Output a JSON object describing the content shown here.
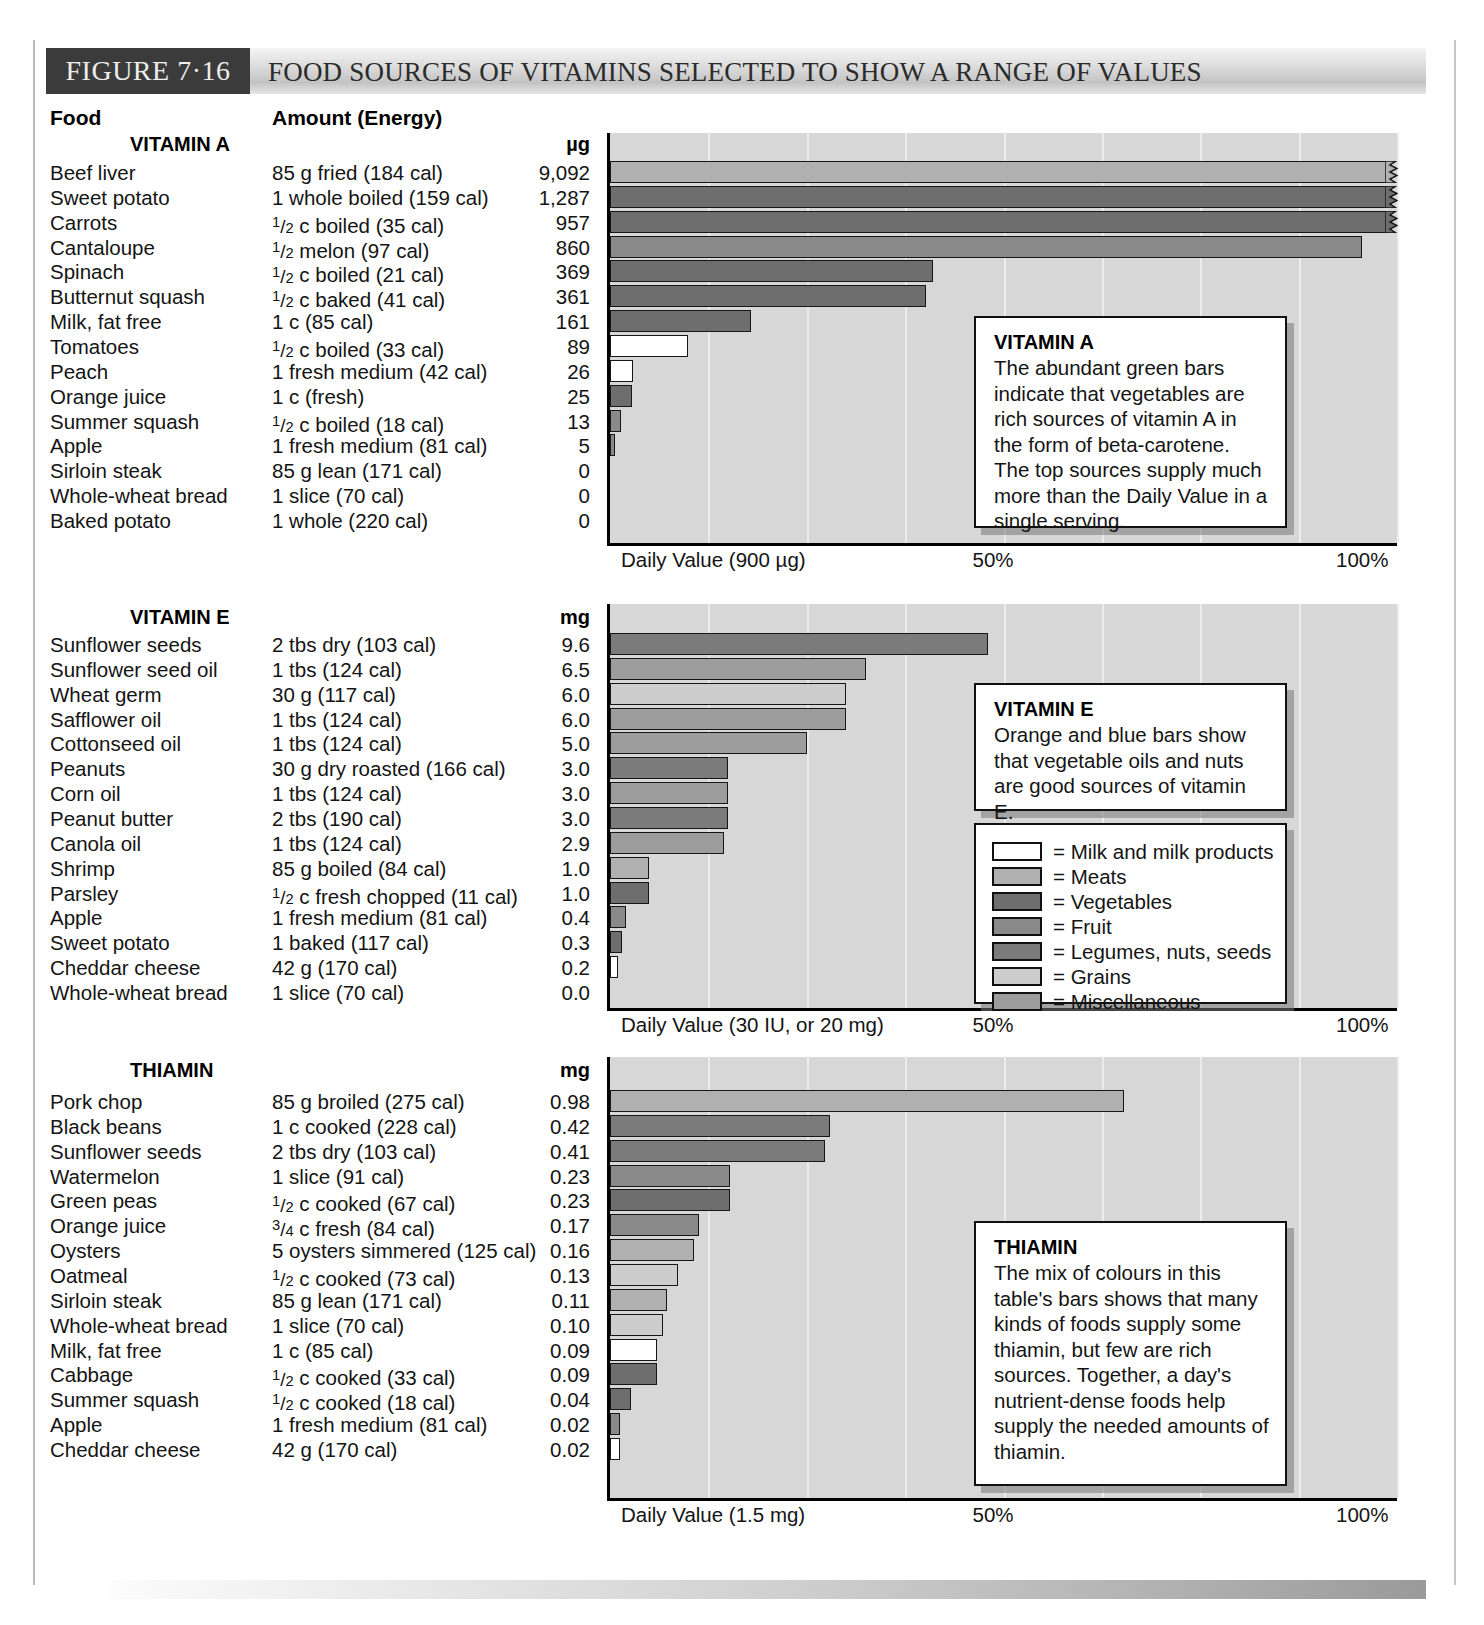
{
  "header": {
    "figure_tag": "FIGURE 7·16",
    "title": "FOOD SOURCES OF VITAMINS SELECTED TO SHOW A RANGE OF VALUES"
  },
  "columns": {
    "food": "Food",
    "amount": "Amount (Energy)"
  },
  "legend": {
    "items": [
      {
        "label": "= Milk and milk products",
        "key": "milk",
        "color": "#ffffff"
      },
      {
        "label": "= Meats",
        "key": "meat",
        "color": "#b0b0b0"
      },
      {
        "label": "= Vegetables",
        "key": "veg",
        "color": "#6e6e6e"
      },
      {
        "label": "= Fruit",
        "key": "fruit",
        "color": "#8a8a8a"
      },
      {
        "label": "= Legumes, nuts, seeds",
        "key": "legume",
        "color": "#7b7b7b"
      },
      {
        "label": "= Grains",
        "key": "grain",
        "color": "#cdcdcd"
      },
      {
        "label": "= Miscellaneous",
        "key": "misc",
        "color": "#9d9d9d"
      }
    ]
  },
  "callouts": {
    "vitamin_a": {
      "title": "VITAMIN A",
      "body": "The abundant green bars indicate that vegetables are rich sources of vitamin A in the form of beta-carotene. The top sources supply much more than the Daily Value in a single serving."
    },
    "vitamin_e": {
      "title": "VITAMIN E",
      "body": "Orange and blue bars show that vegetable oils and nuts are good sources of vitamin E."
    },
    "thiamin": {
      "title": "THIAMIN",
      "body": "The mix of colours in this table's bars shows that many kinds of foods supply some thiamin, but few are rich sources. Together, a day's nutrient-dense foods help supply the needed amounts of thiamin."
    }
  },
  "chart_data": [
    {
      "type": "bar",
      "title": "VITAMIN A",
      "unit": "µg",
      "xlabel": "Daily Value (900 µg)",
      "ticks": [
        "Daily Value (900 µg)",
        "50%",
        "100%"
      ],
      "xlim": [
        0,
        100
      ],
      "daily_value": 900,
      "daily_value_unit": "µg",
      "grid": true,
      "categories": [
        "Beef liver",
        "Sweet potato",
        "Carrots",
        "Cantaloupe",
        "Spinach",
        "Butternut squash",
        "Milk, fat free",
        "Tomatoes",
        "Peach",
        "Orange juice",
        "Summer squash",
        "Apple",
        "Sirloin steak",
        "Whole-wheat bread",
        "Baked potato"
      ],
      "amounts": [
        "85 g fried (184 cal)",
        "1 whole boiled (159 cal)",
        "½ c boiled (35 cal)",
        "½ melon (97 cal)",
        "½ c boiled (21 cal)",
        "½ c baked (41 cal)",
        "1 c (85 cal)",
        "½ c boiled (33 cal)",
        "1 fresh medium (42 cal)",
        "1 c (fresh)",
        "½ c boiled (18 cal)",
        "1 fresh medium (81 cal)",
        "85 g lean (171 cal)",
        "1 slice (70 cal)",
        "1 whole (220 cal)"
      ],
      "value_labels": [
        "9,092",
        "1,287",
        "957",
        "860",
        "369",
        "361",
        "161",
        "89",
        "26",
        "25",
        "13",
        "5",
        "0",
        "0",
        "0"
      ],
      "values": [
        9092,
        1287,
        957,
        860,
        369,
        361,
        161,
        89,
        26,
        25,
        13,
        5,
        0,
        0,
        0
      ],
      "percent_dv": [
        100,
        100,
        100,
        95.6,
        41.0,
        40.1,
        17.9,
        9.9,
        2.9,
        2.8,
        1.4,
        0.6,
        0,
        0,
        0
      ],
      "offscale": [
        true,
        true,
        true,
        false,
        false,
        false,
        false,
        false,
        false,
        false,
        false,
        false,
        false,
        false,
        false
      ],
      "groups": [
        "meat",
        "veg",
        "veg",
        "fruit",
        "veg",
        "veg",
        "veg",
        "milk",
        "milk",
        "veg",
        "fruit",
        "fruit",
        "meat",
        "grain",
        "veg"
      ]
    },
    {
      "type": "bar",
      "title": "VITAMIN E",
      "unit": "mg",
      "xlabel": "Daily Value (30 IU, or 20 mg)",
      "ticks": [
        "Daily Value (30 IU, or 20 mg)",
        "50%",
        "100%"
      ],
      "xlim": [
        0,
        100
      ],
      "daily_value": 20,
      "daily_value_unit": "mg",
      "grid": true,
      "categories": [
        "Sunflower seeds",
        "Sunflower seed oil",
        "Wheat germ",
        "Safflower oil",
        "Cottonseed oil",
        "Peanuts",
        "Corn oil",
        "Peanut butter",
        "Canola oil",
        "Shrimp",
        "Parsley",
        "Apple",
        "Sweet potato",
        "Cheddar cheese",
        "Whole-wheat bread"
      ],
      "amounts": [
        "2 tbs dry (103 cal)",
        "1 tbs (124 cal)",
        "30 g (117 cal)",
        "1 tbs (124 cal)",
        "1 tbs (124 cal)",
        "30 g dry roasted (166 cal)",
        "1 tbs (124 cal)",
        "2 tbs (190 cal)",
        "1 tbs (124 cal)",
        "85 g boiled (84 cal)",
        "½ c fresh chopped (11 cal)",
        "1 fresh medium (81 cal)",
        "1 baked (117 cal)",
        "42 g (170 cal)",
        "1 slice (70 cal)"
      ],
      "value_labels": [
        "9.6",
        "6.5",
        "6.0",
        "6.0",
        "5.0",
        "3.0",
        "3.0",
        "3.0",
        "2.9",
        "1.0",
        "1.0",
        "0.4",
        "0.3",
        "0.2",
        "0.0"
      ],
      "values": [
        9.6,
        6.5,
        6.0,
        6.0,
        5.0,
        3.0,
        3.0,
        3.0,
        2.9,
        1.0,
        1.0,
        0.4,
        0.3,
        0.2,
        0.0
      ],
      "percent_dv": [
        48,
        32.5,
        30,
        30,
        25,
        15,
        15,
        15,
        14.5,
        5,
        5,
        2,
        1.5,
        1,
        0
      ],
      "offscale": [
        false,
        false,
        false,
        false,
        false,
        false,
        false,
        false,
        false,
        false,
        false,
        false,
        false,
        false,
        false
      ],
      "groups": [
        "legume",
        "misc",
        "grain",
        "misc",
        "misc",
        "legume",
        "misc",
        "legume",
        "misc",
        "meat",
        "veg",
        "fruit",
        "veg",
        "milk",
        "grain"
      ]
    },
    {
      "type": "bar",
      "title": "THIAMIN",
      "unit": "mg",
      "xlabel": "Daily Value (1.5 mg)",
      "ticks": [
        "Daily Value (1.5 mg)",
        "50%",
        "100%"
      ],
      "xlim": [
        0,
        100
      ],
      "daily_value": 1.5,
      "daily_value_unit": "mg",
      "grid": true,
      "categories": [
        "Pork chop",
        "Black beans",
        "Sunflower seeds",
        "Watermelon",
        "Green peas",
        "Orange juice",
        "Oysters",
        "Oatmeal",
        "Sirloin steak",
        "Whole-wheat bread",
        "Milk, fat free",
        "Cabbage",
        "Summer squash",
        "Apple",
        "Cheddar cheese"
      ],
      "amounts": [
        "85 g broiled  (275 cal)",
        "1 c cooked (228 cal)",
        "2 tbs dry (103 cal)",
        "1 slice (91 cal)",
        "½ c cooked (67 cal)",
        "¾ c fresh (84 cal)",
        "5 oysters simmered (125 cal)",
        "½ c cooked (73 cal)",
        "85 g lean (171 cal)",
        "1 slice (70 cal)",
        "1 c (85 cal)",
        "½ c cooked (33 cal)",
        "½ c cooked (18 cal)",
        "1 fresh medium (81 cal)",
        "42 g (170 cal)"
      ],
      "value_labels": [
        "0.98",
        "0.42",
        "0.41",
        "0.23",
        "0.23",
        "0.17",
        "0.16",
        "0.13",
        "0.11",
        "0.10",
        "0.09",
        "0.09",
        "0.04",
        "0.02",
        "0.02"
      ],
      "values": [
        0.98,
        0.42,
        0.41,
        0.23,
        0.23,
        0.17,
        0.16,
        0.13,
        0.11,
        0.1,
        0.09,
        0.09,
        0.04,
        0.02,
        0.02
      ],
      "percent_dv": [
        65.3,
        28.0,
        27.3,
        15.3,
        15.3,
        11.3,
        10.7,
        8.7,
        7.3,
        6.7,
        6.0,
        6.0,
        2.7,
        1.3,
        1.3
      ],
      "offscale": [
        false,
        false,
        false,
        false,
        false,
        false,
        false,
        false,
        false,
        false,
        false,
        false,
        false,
        false,
        false
      ],
      "groups": [
        "meat",
        "legume",
        "legume",
        "fruit",
        "veg",
        "fruit",
        "meat",
        "grain",
        "meat",
        "grain",
        "milk",
        "veg",
        "veg",
        "fruit",
        "milk"
      ]
    }
  ]
}
